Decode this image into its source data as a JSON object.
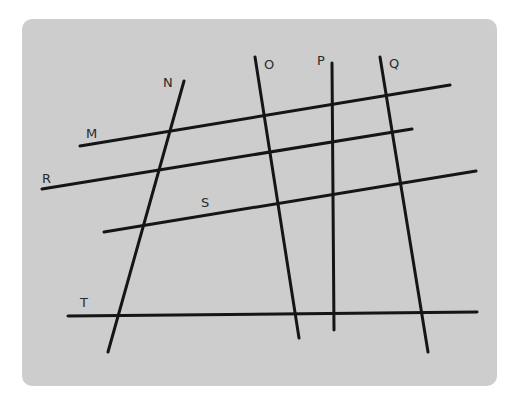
{
  "diagram": {
    "type": "line-intersection-figure",
    "background_color": "#cdcdcd",
    "line_color": "#151515",
    "lines": [
      {
        "id": "M",
        "label": "M",
        "x1": 80,
        "y1": 146,
        "x2": 450,
        "y2": 85,
        "label_x": 86,
        "label_y": 138
      },
      {
        "id": "R",
        "label": "R",
        "x1": 42,
        "y1": 189,
        "x2": 412,
        "y2": 129,
        "label_x": 42,
        "label_y": 183
      },
      {
        "id": "S",
        "label": "S",
        "x1": 104,
        "y1": 232,
        "x2": 476,
        "y2": 171,
        "label_x": 201,
        "label_y": 207
      },
      {
        "id": "T",
        "label": "T",
        "x1": 68,
        "y1": 316,
        "x2": 477,
        "y2": 312,
        "label_x": 80,
        "label_y": 307
      },
      {
        "id": "N",
        "label": "N",
        "x1": 184,
        "y1": 81,
        "x2": 108,
        "y2": 352,
        "label_x": 163,
        "label_y": 87
      },
      {
        "id": "O",
        "label": "O",
        "x1": 255,
        "y1": 57,
        "x2": 299,
        "y2": 338,
        "label_x": 264,
        "label_y": 69
      },
      {
        "id": "P",
        "label": "P",
        "x1": 332,
        "y1": 63,
        "x2": 334,
        "y2": 330,
        "label_x": 317,
        "label_y": 65
      },
      {
        "id": "Q",
        "label": "Q",
        "x1": 380,
        "y1": 57,
        "x2": 428,
        "y2": 352,
        "label_x": 389,
        "label_y": 68
      }
    ]
  }
}
